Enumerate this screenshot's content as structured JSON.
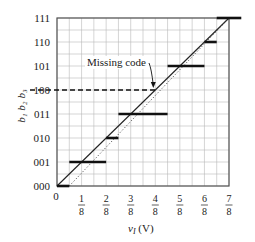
{
  "figure": {
    "annotation": "Missing code",
    "x_axis_label_var": "v",
    "x_axis_label_sub": "I",
    "x_axis_label_unit": "(V)",
    "y_axis_label": "b₁ b₂ b₃"
  },
  "colors": {
    "background": "#ffffff",
    "grid": "#b8b8b8",
    "frame": "#555555",
    "steps": "#111111",
    "ideal_line": "#222222",
    "dotted_line": "#444444",
    "text": "#1a1a1a"
  },
  "chart_data": {
    "type": "line",
    "title": "",
    "xlabel": "v_I (V)",
    "ylabel": "b1 b2 b3",
    "xlim": [
      0,
      7
    ],
    "x_unit": "1/8 V",
    "x_ticks": [
      {
        "value": 0,
        "num": "0",
        "den": ""
      },
      {
        "value": 1,
        "num": "1",
        "den": "8"
      },
      {
        "value": 2,
        "num": "2",
        "den": "8"
      },
      {
        "value": 3,
        "num": "3",
        "den": "8"
      },
      {
        "value": 4,
        "num": "4",
        "den": "8"
      },
      {
        "value": 5,
        "num": "5",
        "den": "8"
      },
      {
        "value": 6,
        "num": "6",
        "den": "8"
      },
      {
        "value": 7,
        "num": "7",
        "den": "8"
      }
    ],
    "y_ticks": [
      "000",
      "001",
      "010",
      "011",
      "100",
      "101",
      "110",
      "111"
    ],
    "grid": true,
    "grid_step_x": 0.5,
    "grid_step_y": 0.5,
    "series": [
      {
        "name": "ADC output steps (actual)",
        "style": "thick-solid",
        "segments": [
          {
            "code": "000",
            "level": 0,
            "x_start": 0,
            "x_end": 0.5
          },
          {
            "code": "001",
            "level": 1,
            "x_start": 0.5,
            "x_end": 2
          },
          {
            "code": "010",
            "level": 2,
            "x_start": 2,
            "x_end": 2.5
          },
          {
            "code": "011",
            "level": 3,
            "x_start": 2.5,
            "x_end": 4.5
          },
          {
            "code": "101",
            "level": 5,
            "x_start": 4.5,
            "x_end": 6
          },
          {
            "code": "110",
            "level": 6,
            "x_start": 6,
            "x_end": 6.5
          },
          {
            "code": "111",
            "level": 7,
            "x_start": 6.5,
            "x_end": 7.5
          }
        ]
      },
      {
        "name": "Missing code 100",
        "style": "dashed",
        "segments": [
          {
            "code": "100",
            "level": 4,
            "x_start": 0,
            "x_end": 4
          }
        ]
      },
      {
        "name": "Ideal transfer line",
        "style": "solid-thin",
        "points": [
          [
            0,
            0
          ],
          [
            7,
            7
          ]
        ]
      },
      {
        "name": "Offset reference line",
        "style": "dotted",
        "points": [
          [
            0.5,
            0
          ],
          [
            7,
            7
          ]
        ]
      }
    ],
    "annotations": [
      {
        "text": "Missing code",
        "arrow_to": [
          4,
          4
        ]
      }
    ]
  }
}
